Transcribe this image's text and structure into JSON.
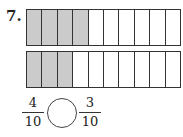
{
  "problem": {
    "number_label": "7.",
    "bars": [
      {
        "total_parts": 10,
        "shaded_parts": 4
      },
      {
        "total_parts": 10,
        "shaded_parts": 3
      }
    ],
    "fractions": {
      "left": {
        "numerator": "4",
        "denominator": "10"
      },
      "right": {
        "numerator": "3",
        "denominator": "10"
      }
    },
    "comparison_symbol": ""
  },
  "colors": {
    "shaded": "#cbcbcb",
    "unshaded": "#ffffff",
    "border": "#333333"
  }
}
